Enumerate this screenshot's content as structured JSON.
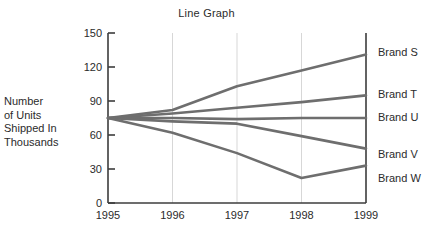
{
  "chart_data": {
    "type": "line",
    "title": "Line Graph",
    "xlabel": "",
    "ylabel": "Number of Units Shipped In Thousands",
    "x": [
      "1995",
      "1996",
      "1997",
      "1998",
      "1999"
    ],
    "xlim": [
      1995,
      1999
    ],
    "ylim": [
      0,
      150
    ],
    "yticks": [
      0,
      30,
      60,
      90,
      120,
      150
    ],
    "ytick_labels": [
      "0",
      "30",
      "60",
      "90",
      "120",
      "150"
    ],
    "grid": "vertical",
    "legend_position": "right-of-axis",
    "line_color": "#6e6e6e",
    "axis_color": "#3c3c3c",
    "gridline_color": "#d7d7d7",
    "series": [
      {
        "name": "Brand S",
        "values": [
          75,
          82,
          103,
          117,
          131
        ]
      },
      {
        "name": "Brand T",
        "values": [
          75,
          79,
          84,
          89,
          95
        ]
      },
      {
        "name": "Brand U",
        "values": [
          75,
          75,
          74,
          75,
          75
        ]
      },
      {
        "name": "Brand V",
        "values": [
          75,
          72,
          70,
          59,
          48
        ]
      },
      {
        "name": "Brand W",
        "values": [
          75,
          62,
          44,
          22,
          33
        ]
      }
    ]
  },
  "labels": {
    "title": "Line Graph",
    "ylabel_lines": [
      "Number",
      "of Units",
      "Shipped In",
      "Thousands"
    ],
    "series_names": [
      "Brand S",
      "Brand T",
      "Brand U",
      "Brand V",
      "Brand W"
    ],
    "x_ticks": [
      "1995",
      "1996",
      "1997",
      "1998",
      "1999"
    ],
    "y_ticks": [
      "150",
      "120",
      "90",
      "60",
      "30",
      "0"
    ]
  }
}
